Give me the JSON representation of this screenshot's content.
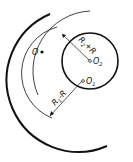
{
  "diagram": {
    "type": "tangent-arc-construction",
    "labels": {
      "point_o": "O",
      "center_o1": "O",
      "center_o1_sub": "1",
      "center_o2": "O",
      "center_o2_sub": "2",
      "dim_r2_main": "R",
      "dim_r2_sub": "2",
      "dim_r2_rest": "+R",
      "dim_r1_main": "R",
      "dim_r1_sub": "1",
      "dim_r1_rest": "-R"
    },
    "colors": {
      "stroke": "#111111",
      "background": "#ffffff"
    }
  }
}
